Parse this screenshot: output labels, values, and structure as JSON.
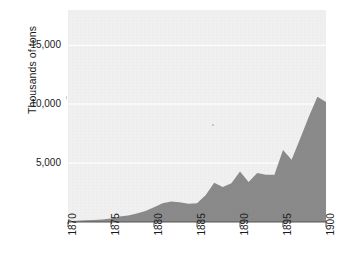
{
  "chart_data": {
    "type": "area",
    "title": "",
    "subtitle": "",
    "xlabel": "",
    "ylabel": "Thousands of tons",
    "xlim": [
      1870,
      1900
    ],
    "ylim": [
      0,
      18000
    ],
    "ytick_labels": [
      "5,000",
      "10,000",
      "15,000"
    ],
    "ytick_values": [
      5000,
      10000,
      15000
    ],
    "xtick_labels": [
      "1870",
      "1875",
      "1880",
      "1885",
      "1890",
      "1895",
      "1900"
    ],
    "xtick_values": [
      1870,
      1875,
      1880,
      1885,
      1890,
      1895,
      1900
    ],
    "grid": true,
    "legend": null,
    "series_name": "Output",
    "x": [
      1870,
      1871,
      1872,
      1873,
      1874,
      1875,
      1876,
      1877,
      1878,
      1879,
      1880,
      1881,
      1882,
      1883,
      1884,
      1885,
      1886,
      1887,
      1888,
      1889,
      1890,
      1891,
      1892,
      1893,
      1894,
      1895,
      1896,
      1897,
      1898,
      1899,
      1900
    ],
    "values": [
      70,
      100,
      140,
      180,
      210,
      290,
      470,
      560,
      730,
      940,
      1250,
      1590,
      1740,
      1680,
      1560,
      1600,
      2270,
      3340,
      2980,
      3290,
      4280,
      3400,
      4170,
      4020,
      4020,
      6110,
      5280,
      7100,
      8930,
      10640,
      10190
    ],
    "colors": {
      "area_fill": "#8a8a8a",
      "panel_background": "#f0f0f0",
      "page_background": "#ffffff",
      "grid": "#ffffff",
      "text": "#1a1a1a",
      "axis": "#555555"
    }
  },
  "axes": {
    "y_title": "Thousands of tons"
  }
}
